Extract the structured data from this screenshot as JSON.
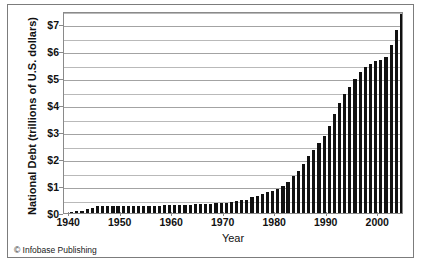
{
  "figure": {
    "credit": "© Infobase Publishing",
    "background_color": "#ffffff",
    "frame_color": "#7c7c7c",
    "bar_color": "#111111",
    "gridline_color": "#b9b9b9"
  },
  "chart_data": {
    "type": "bar",
    "title": "",
    "subtitle": "",
    "xlabel": "Year",
    "ylabel": "National Debt (trillions of  U.S. dollars)",
    "xlim": [
      1939,
      2005
    ],
    "ylim": [
      0,
      7.5
    ],
    "grid": true,
    "grid_major_step": 1,
    "grid_minor_step": 0.5,
    "legend": "none",
    "ytick_labels": [
      "$0",
      "$1",
      "$2",
      "$3",
      "$4",
      "$5",
      "$6",
      "$7"
    ],
    "ytick_values": [
      0,
      1,
      2,
      3,
      4,
      5,
      6,
      7
    ],
    "xtick_labels": [
      "1940",
      "1950",
      "1960",
      "1970",
      "1980",
      "1990",
      "2000"
    ],
    "xtick_values": [
      1940,
      1950,
      1960,
      1970,
      1980,
      1990,
      2000
    ],
    "categories": [
      1940,
      1941,
      1942,
      1943,
      1944,
      1945,
      1946,
      1947,
      1948,
      1949,
      1950,
      1951,
      1952,
      1953,
      1954,
      1955,
      1956,
      1957,
      1958,
      1959,
      1960,
      1961,
      1962,
      1963,
      1964,
      1965,
      1966,
      1967,
      1968,
      1969,
      1970,
      1971,
      1972,
      1973,
      1974,
      1975,
      1976,
      1977,
      1978,
      1979,
      1980,
      1981,
      1982,
      1983,
      1984,
      1985,
      1986,
      1987,
      1988,
      1989,
      1990,
      1991,
      1992,
      1993,
      1994,
      1995,
      1996,
      1997,
      1998,
      1999,
      2000,
      2001,
      2002,
      2003,
      2004
    ],
    "values": [
      0.05,
      0.06,
      0.08,
      0.14,
      0.2,
      0.26,
      0.27,
      0.26,
      0.25,
      0.25,
      0.26,
      0.26,
      0.26,
      0.27,
      0.27,
      0.27,
      0.27,
      0.27,
      0.28,
      0.29,
      0.29,
      0.29,
      0.3,
      0.31,
      0.32,
      0.32,
      0.33,
      0.34,
      0.36,
      0.37,
      0.38,
      0.41,
      0.44,
      0.47,
      0.49,
      0.58,
      0.65,
      0.72,
      0.78,
      0.83,
      0.91,
      1.0,
      1.14,
      1.38,
      1.57,
      1.82,
      2.13,
      2.35,
      2.6,
      2.87,
      3.23,
      3.67,
      4.07,
      4.41,
      4.69,
      4.97,
      5.22,
      5.41,
      5.53,
      5.66,
      5.67,
      5.81,
      6.23,
      6.78,
      7.38
    ],
    "units": "trillions of U.S. dollars"
  }
}
